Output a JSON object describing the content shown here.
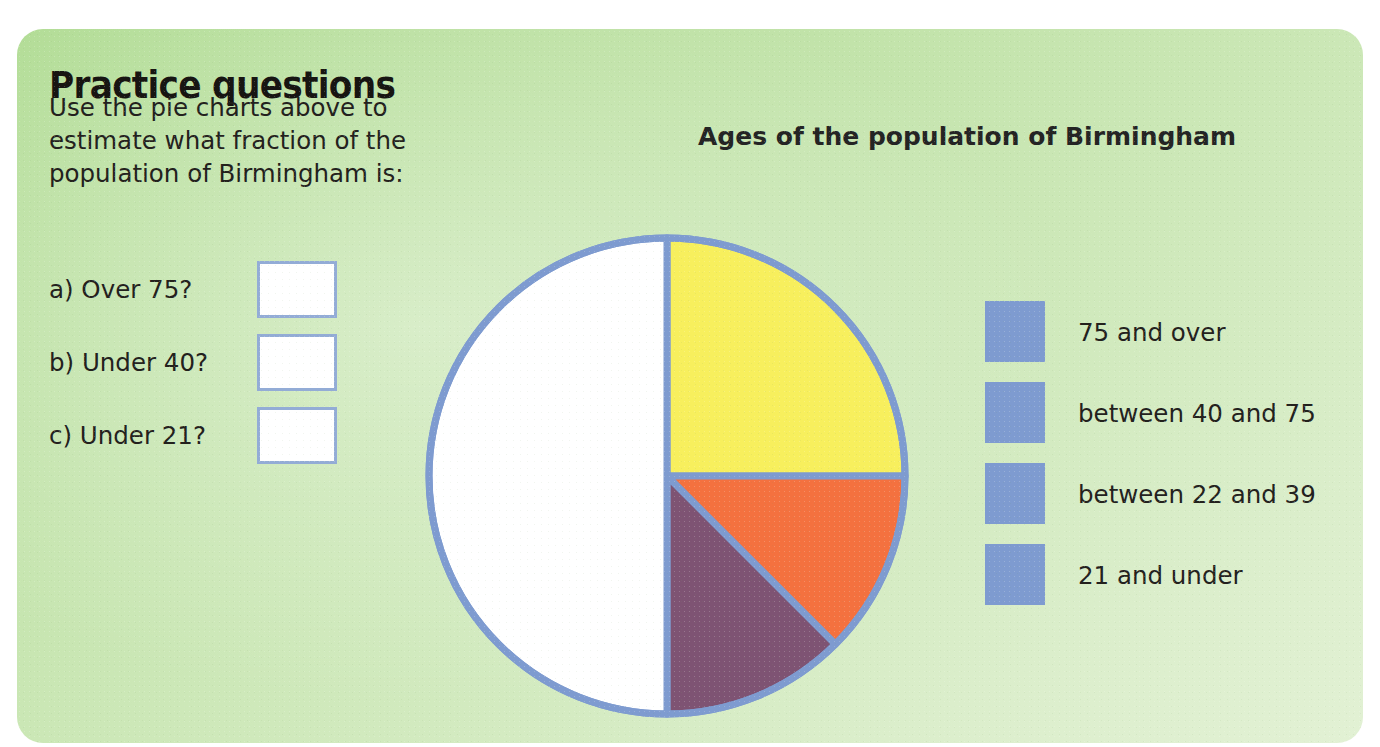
{
  "panel": {
    "background_from": "#b3dd97",
    "background_to": "#e2f1d4"
  },
  "heading": "Practice questions",
  "intro_lines": [
    "Use the pie charts above to",
    "estimate what fraction of the",
    "population of Birmingham is:"
  ],
  "questions": [
    {
      "label": "a) Over 75?",
      "answer": ""
    },
    {
      "label": "b) Under 40?",
      "answer": ""
    },
    {
      "label": "c) Under 21?",
      "answer": ""
    }
  ],
  "chart_data": {
    "type": "pie",
    "title": "Ages of the population of Birmingham",
    "xlabel": "",
    "ylabel": "",
    "grid": false,
    "legend_position": "right",
    "start_angle_deg": 0,
    "direction": "clockwise",
    "stroke_color": "#7e9bd0",
    "stroke_width_px": 7,
    "categories": [
      "75 and over",
      "between 40 and 75",
      "between 22 and 39",
      "21 and under"
    ],
    "values": [
      25,
      12.5,
      12.5,
      50
    ],
    "value_unit": "percent",
    "fractions": [
      "1/4",
      "1/8",
      "1/8",
      "1/2"
    ],
    "angles_deg": [
      90,
      45,
      45,
      180
    ],
    "colors": [
      "#f7ef5d",
      "#f4713f",
      "#7e5373",
      "#ffffff"
    ],
    "slices": [
      {
        "label": "75 and over",
        "value": 25,
        "fraction": "1/4",
        "angle_deg": 90,
        "color": "#f7ef5d"
      },
      {
        "label": "between 40 and 75",
        "value": 12.5,
        "fraction": "1/8",
        "angle_deg": 45,
        "color": "#f4713f"
      },
      {
        "label": "between 22 and 39",
        "value": 12.5,
        "fraction": "1/8",
        "angle_deg": 45,
        "color": "#7e5373"
      },
      {
        "label": "21 and under",
        "value": 50,
        "fraction": "1/2",
        "angle_deg": 180,
        "color": "#ffffff"
      }
    ]
  },
  "legend": [
    {
      "label": "75 and over",
      "color": "#f7ef5d"
    },
    {
      "label": "between 40 and 75",
      "color": "#f4713f"
    },
    {
      "label": "between 22 and 39",
      "color": "#7e5373"
    },
    {
      "label": "21 and under",
      "color": "#ffffff"
    }
  ]
}
